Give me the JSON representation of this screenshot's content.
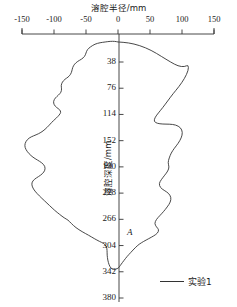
{
  "chart_data": {
    "type": "line",
    "title": "",
    "xlabel": "溶腔半径/mm",
    "ylabel": "溶腔深度/mm",
    "xticks": [
      -150,
      -100,
      -50,
      0,
      50,
      100,
      150
    ],
    "xtick_labels": [
      "-150",
      "-100",
      "-50",
      "0",
      "50",
      "100",
      "150"
    ],
    "yticks": [
      38,
      76,
      114,
      152,
      190,
      228,
      266,
      304,
      342,
      380
    ],
    "ytick_labels": [
      "38",
      "76",
      "114",
      "152",
      "190",
      "228",
      "266",
      "304",
      "342",
      "380"
    ],
    "xlim": [
      -150,
      150
    ],
    "ylim": [
      0,
      380
    ],
    "y_axis_inverted": true,
    "x_axis_position": "top",
    "grid": false,
    "legend_position": "bottom-right",
    "series": [
      {
        "name": "实验1",
        "color": "#333333",
        "description": "Closed outline of a solution cavity profile; radius on x, depth on y",
        "points": [
          [
            0,
            9
          ],
          [
            16,
            10
          ],
          [
            34,
            14
          ],
          [
            52,
            21
          ],
          [
            68,
            30
          ],
          [
            82,
            38
          ],
          [
            94,
            44
          ],
          [
            104,
            45
          ],
          [
            110,
            42
          ],
          [
            110,
            50
          ],
          [
            104,
            62
          ],
          [
            95,
            74
          ],
          [
            86,
            84
          ],
          [
            78,
            94
          ],
          [
            70,
            104
          ],
          [
            63,
            112
          ],
          [
            58,
            118
          ],
          [
            56,
            124
          ],
          [
            61,
            127
          ],
          [
            70,
            128
          ],
          [
            80,
            128
          ],
          [
            90,
            129
          ],
          [
            98,
            133
          ],
          [
            101,
            140
          ],
          [
            99,
            148
          ],
          [
            94,
            156
          ],
          [
            88,
            163
          ],
          [
            83,
            170
          ],
          [
            80,
            177
          ],
          [
            78,
            184
          ],
          [
            80,
            190
          ],
          [
            78,
            196
          ],
          [
            73,
            202
          ],
          [
            68,
            208
          ],
          [
            64,
            214
          ],
          [
            66,
            220
          ],
          [
            72,
            224
          ],
          [
            79,
            228
          ],
          [
            83,
            234
          ],
          [
            82,
            241
          ],
          [
            77,
            248
          ],
          [
            71,
            255
          ],
          [
            65,
            261
          ],
          [
            60,
            266
          ],
          [
            57,
            272
          ],
          [
            60,
            277
          ],
          [
            64,
            281
          ],
          [
            62,
            286
          ],
          [
            56,
            290
          ],
          [
            48,
            294
          ],
          [
            40,
            298
          ],
          [
            33,
            302
          ],
          [
            27,
            307
          ],
          [
            20,
            314
          ],
          [
            14,
            320
          ],
          [
            9,
            326
          ],
          [
            5,
            331
          ],
          [
            2,
            335
          ],
          [
            0,
            337
          ],
          [
            -3,
            338
          ],
          [
            -7,
            339
          ],
          [
            -11,
            337
          ],
          [
            -14,
            332
          ],
          [
            -16,
            325
          ],
          [
            -17,
            318
          ],
          [
            -17,
            311
          ],
          [
            -18,
            305
          ],
          [
            -22,
            301
          ],
          [
            -29,
            298
          ],
          [
            -37,
            294
          ],
          [
            -46,
            289
          ],
          [
            -56,
            284
          ],
          [
            -66,
            278
          ],
          [
            -73,
            272
          ],
          [
            -78,
            267
          ],
          [
            -84,
            264
          ],
          [
            -91,
            259
          ],
          [
            -99,
            253
          ],
          [
            -107,
            246
          ],
          [
            -115,
            239
          ],
          [
            -123,
            232
          ],
          [
            -130,
            225
          ],
          [
            -134,
            219
          ],
          [
            -135,
            213
          ],
          [
            -131,
            208
          ],
          [
            -124,
            204
          ],
          [
            -118,
            200
          ],
          [
            -114,
            195
          ],
          [
            -114,
            189
          ],
          [
            -119,
            184
          ],
          [
            -126,
            180
          ],
          [
            -133,
            176
          ],
          [
            -139,
            171
          ],
          [
            -144,
            165
          ],
          [
            -146,
            159
          ],
          [
            -144,
            153
          ],
          [
            -139,
            148
          ],
          [
            -132,
            145
          ],
          [
            -124,
            142
          ],
          [
            -117,
            138
          ],
          [
            -111,
            133
          ],
          [
            -106,
            128
          ],
          [
            -101,
            123
          ],
          [
            -96,
            119
          ],
          [
            -92,
            115
          ],
          [
            -89,
            111
          ],
          [
            -91,
            107
          ],
          [
            -96,
            104
          ],
          [
            -100,
            100
          ],
          [
            -101,
            95
          ],
          [
            -98,
            90
          ],
          [
            -93,
            86
          ],
          [
            -89,
            82
          ],
          [
            -88,
            77
          ],
          [
            -89,
            72
          ],
          [
            -87,
            67
          ],
          [
            -83,
            63
          ],
          [
            -78,
            60
          ],
          [
            -74,
            56
          ],
          [
            -72,
            51
          ],
          [
            -71,
            46
          ],
          [
            -68,
            41
          ],
          [
            -63,
            37
          ],
          [
            -57,
            34
          ],
          [
            -52,
            30
          ],
          [
            -50,
            25
          ],
          [
            -48,
            20
          ],
          [
            -43,
            16
          ],
          [
            -36,
            12
          ],
          [
            -28,
            10
          ],
          [
            -20,
            9
          ],
          [
            -12,
            8
          ],
          [
            -5,
            8
          ],
          [
            0,
            9
          ]
        ]
      }
    ],
    "annotations": [
      {
        "label": "A",
        "x": 14,
        "y": 294
      }
    ]
  },
  "legend": {
    "entries": [
      {
        "label": "实验1"
      }
    ]
  }
}
